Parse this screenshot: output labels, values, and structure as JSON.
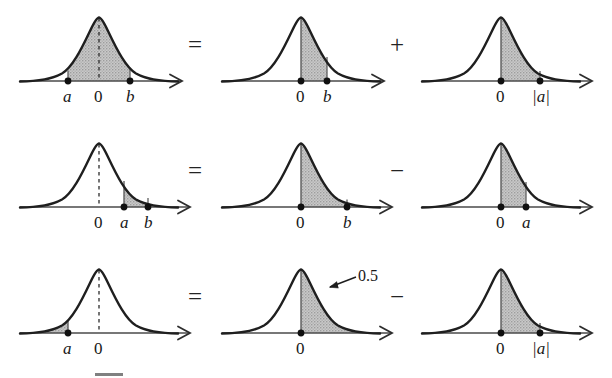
{
  "figure": {
    "kind": "normal-distribution-area-identities",
    "operators": {
      "equals": "=",
      "plus": "+",
      "minus": "−"
    },
    "annotation_label": "0.5",
    "colors": {
      "curve": "#1f1f1f",
      "axis": "#4a4a4a",
      "shade_fill": "#b6b6b6",
      "shade_edge": "#6f6f6f",
      "dashed": "#2b2b2b",
      "marker": "#101010",
      "text": "#181818",
      "background": "#ffffff"
    },
    "rows": [
      {
        "id": "row-ab",
        "operator_1": "=",
        "operator_2": "+",
        "panels": [
          {
            "id": "r1p1",
            "shade": "a-to-b",
            "center_dashed": true,
            "ticks": [
              {
                "label": "a",
                "italic": true,
                "x": 58
              },
              {
                "label": "0",
                "italic": false,
                "x": 89
              },
              {
                "label": "b",
                "italic": true,
                "x": 120
              }
            ]
          },
          {
            "id": "r1p2",
            "shade": "0-to-b",
            "center_dashed": false,
            "ticks": [
              {
                "label": "0",
                "italic": false,
                "x": 89
              },
              {
                "label": "b",
                "italic": true,
                "x": 115
              }
            ]
          },
          {
            "id": "r1p3",
            "shade": "0-to-absa",
            "center_dashed": false,
            "ticks": [
              {
                "label": "0",
                "italic": false,
                "x": 89
              },
              {
                "label": "|a|",
                "italic": true,
                "x": 128
              }
            ]
          }
        ]
      },
      {
        "id": "row-a-to-b-positive",
        "operator_1": "=",
        "operator_2": "−",
        "panels": [
          {
            "id": "r2p1",
            "shade": "a-to-b-right",
            "center_dashed": true,
            "ticks": [
              {
                "label": "0",
                "italic": false,
                "x": 89
              },
              {
                "label": "a",
                "italic": true,
                "x": 114
              },
              {
                "label": "b",
                "italic": true,
                "x": 138
              }
            ]
          },
          {
            "id": "r2p2",
            "shade": "0-to-b-wide",
            "center_dashed": false,
            "ticks": [
              {
                "label": "0",
                "italic": false,
                "x": 89
              },
              {
                "label": "b",
                "italic": true,
                "x": 135
              }
            ]
          },
          {
            "id": "r2p3",
            "shade": "0-to-a",
            "center_dashed": false,
            "ticks": [
              {
                "label": "0",
                "italic": false,
                "x": 89
              },
              {
                "label": "a",
                "italic": true,
                "x": 114
              }
            ]
          }
        ]
      },
      {
        "id": "row-left-tail",
        "operator_1": "=",
        "operator_2": "−",
        "panels": [
          {
            "id": "r3p1",
            "shade": "left-tail-to-a",
            "center_dashed": true,
            "ticks": [
              {
                "label": "a",
                "italic": true,
                "x": 58
              },
              {
                "label": "0",
                "italic": false,
                "x": 89
              }
            ]
          },
          {
            "id": "r3p2",
            "shade": "right-half",
            "center_dashed": false,
            "annotation": "0.5",
            "ticks": [
              {
                "label": "0",
                "italic": false,
                "x": 89
              }
            ]
          },
          {
            "id": "r3p3",
            "shade": "0-to-absa",
            "center_dashed": false,
            "ticks": [
              {
                "label": "0",
                "italic": false,
                "x": 89
              },
              {
                "label": "|a|",
                "italic": true,
                "x": 128
              }
            ]
          }
        ]
      }
    ]
  }
}
